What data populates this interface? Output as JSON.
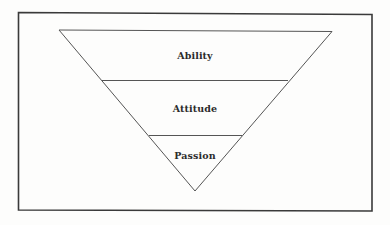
{
  "diagram": {
    "type": "inverted-pyramid",
    "layers": [
      {
        "label": "Ability",
        "position": "top"
      },
      {
        "label": "Attitude",
        "position": "middle"
      },
      {
        "label": "Passion",
        "position": "bottom"
      }
    ],
    "colors": {
      "stroke": "#555555",
      "frame": "#3a3a3a",
      "text": "#2b2b2b",
      "background": "#fdfdfc"
    }
  }
}
